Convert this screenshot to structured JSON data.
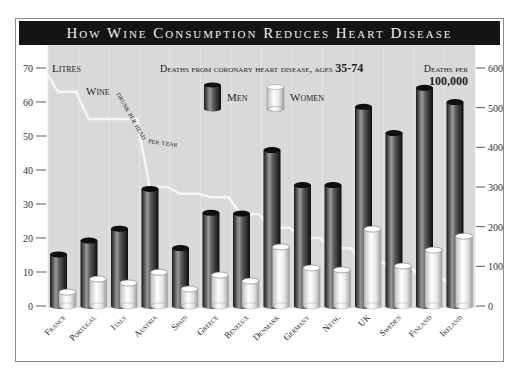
{
  "title": "How Wine Consumption Reduces Heart Disease",
  "subtitle_prefix": "Deaths from coronary heart disease, ages ",
  "subtitle_ages": "35-74",
  "left_axis_label": "Litres",
  "right_axis_label_line1": "Deaths per",
  "right_axis_label_line2": "100,000",
  "line_label": {
    "w1": "Wine",
    "w2": "drunk per head",
    "w3": "per year"
  },
  "legend": [
    {
      "label": "Men",
      "color": "#3a3a3a"
    },
    {
      "label": "Women",
      "color": "#f0f0f0"
    }
  ],
  "left_ticks": [
    "70",
    "60",
    "50",
    "40",
    "30",
    "20",
    "10",
    "0"
  ],
  "right_ticks": [
    "600",
    "500",
    "400",
    "300",
    "200",
    "100",
    "0"
  ],
  "chart_data": {
    "type": "bar",
    "title": "How Wine Consumption Reduces Heart Disease",
    "subtitle": "Deaths from coronary heart disease, ages 35-74",
    "categories": [
      "France",
      "Portugal",
      "Italy",
      "Austria",
      "Spain",
      "Greece",
      "Benelux",
      "Denmark",
      "Germany",
      "Neth.",
      "UK",
      "Sweden",
      "Finland",
      "Ireland"
    ],
    "series": [
      {
        "name": "Men",
        "axis": "right",
        "unit": "Deaths per 100,000",
        "values": [
          130,
          165,
          195,
          295,
          146,
          235,
          233,
          393,
          305,
          305,
          502,
          436,
          550,
          514
        ]
      },
      {
        "name": "Women",
        "axis": "right",
        "unit": "Deaths per 100,000",
        "values": [
          35,
          68,
          58,
          85,
          43,
          78,
          63,
          149,
          96,
          91,
          194,
          101,
          141,
          176
        ]
      },
      {
        "name": "Wine drunk per head per year",
        "type": "line",
        "axis": "left",
        "unit": "Litres",
        "values": [
          63,
          55,
          55,
          35,
          33,
          32,
          27,
          23,
          20,
          17,
          13,
          11,
          8,
          6
        ]
      }
    ],
    "ylabel_left": "Litres",
    "ylim_left": [
      0,
      70
    ],
    "ylabel_right": "Deaths per 100,000",
    "ylim_right": [
      0,
      600
    ],
    "grid": "vertical light lines",
    "legend_position": "top center"
  }
}
